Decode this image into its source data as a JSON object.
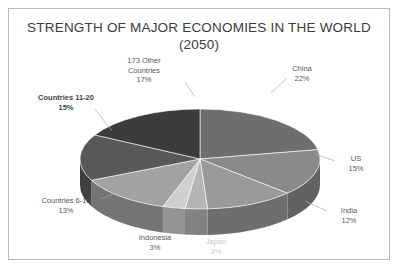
{
  "frame": {
    "border_color": "#b9b9b9"
  },
  "title": {
    "line1": "STRENGTH OF MAJOR ECONOMIES IN THE WORLD",
    "line2": "(2050)",
    "color": "#3b3b3b"
  },
  "chart_data": {
    "type": "pie",
    "title": "STRENGTH OF MAJOR ECONOMIES IN THE WORLD (2050)",
    "subtitle": "(2050)",
    "style": "3d-pie-grayscale",
    "legend": "none",
    "labels_position": "outside-with-leader-lines",
    "units": "percent",
    "total": 100,
    "categories": [
      "China",
      "US",
      "India",
      "Japan",
      "Indonesia",
      "Countries 6-10",
      "Countries 11-20",
      "173 Other Countries"
    ],
    "values": [
      22,
      15,
      12,
      3,
      3,
      13,
      15,
      17
    ],
    "slices": [
      {
        "name": "China",
        "label": "China",
        "value": 22,
        "display": "22%",
        "color": "#6e6e6e",
        "side_color": "#4e4e4e",
        "emphasis": "normal"
      },
      {
        "name": "US",
        "label": "US",
        "value": 15,
        "display": "15%",
        "color": "#8a8a8a",
        "side_color": "#626262",
        "emphasis": "normal"
      },
      {
        "name": "India",
        "label": "India",
        "value": 12,
        "display": "12%",
        "color": "#9a9a9a",
        "side_color": "#6e6e6e",
        "emphasis": "normal"
      },
      {
        "name": "Japan",
        "label": "Japan",
        "value": 3,
        "display": "3%",
        "color": "#b5b5b5",
        "side_color": "#828282",
        "emphasis": "faded"
      },
      {
        "name": "Indonesia",
        "label": "Indonesia",
        "value": 3,
        "display": "3%",
        "color": "#cfcfcf",
        "side_color": "#949494",
        "emphasis": "normal"
      },
      {
        "name": "Countries 6-10",
        "label": "Countries 6-10",
        "value": 13,
        "display": "13%",
        "color": "#a2a2a2",
        "side_color": "#747474",
        "emphasis": "normal"
      },
      {
        "name": "Countries 11-20",
        "label": "Countries 11-20",
        "value": 15,
        "display": "15%",
        "color": "#585858",
        "side_color": "#3f3f3f",
        "emphasis": "bold"
      },
      {
        "name": "173 Other Countries",
        "label": "173 Other Countries",
        "value": 17,
        "display": "17%",
        "color": "#3c3c3c",
        "side_color": "#2b2b2b",
        "emphasis": "normal"
      }
    ]
  },
  "labels": {
    "other_countries": {
      "line1": "173 Other",
      "line2": "Countries",
      "pct": "17%"
    },
    "china": {
      "line1": "China",
      "pct": "22%"
    },
    "countries_11_20": {
      "line1": "Countries 11-20",
      "pct": "15%"
    },
    "us": {
      "line1": "US",
      "pct": "15%"
    },
    "countries_6_10": {
      "line1": "Countries 6-10",
      "pct": "13%"
    },
    "india": {
      "line1": "India",
      "pct": "12%"
    },
    "indonesia": {
      "line1": "Indonesia",
      "pct": "3%"
    },
    "japan": {
      "line1": "Japan",
      "pct": "3%"
    }
  }
}
